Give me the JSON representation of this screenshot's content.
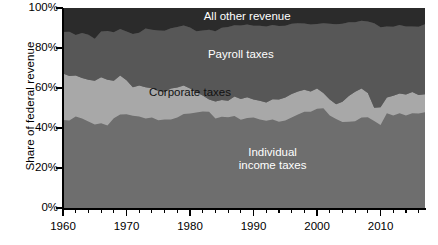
{
  "chart_data": {
    "type": "area",
    "stacked": true,
    "title": "",
    "xlabel": "",
    "ylabel": "Share of federal revenue",
    "xlim": [
      1960,
      2017
    ],
    "ylim": [
      0,
      100
    ],
    "y_tick_labels": [
      "0%",
      "20%",
      "40%",
      "60%",
      "80%",
      "100%"
    ],
    "y_tick_values": [
      0,
      20,
      40,
      60,
      80,
      100
    ],
    "x_tick_labels": [
      "1960",
      "1970",
      "1980",
      "1990",
      "2000",
      "2010"
    ],
    "x_tick_values": [
      1960,
      1970,
      1980,
      1990,
      2000,
      2010
    ],
    "x_minor_tick_interval": 2,
    "grid": false,
    "legend_position": "inline-annotations",
    "colors": {
      "individual_income_taxes": "#6e6e6e",
      "corporate_taxes": "#a8a8a8",
      "payroll_taxes": "#575757",
      "all_other_revenue": "#2b2b2b",
      "axis": "#000000",
      "background": "#ffffff",
      "label_text": "#ffffff"
    },
    "x": [
      1960,
      1961,
      1962,
      1963,
      1964,
      1965,
      1966,
      1967,
      1968,
      1969,
      1970,
      1971,
      1972,
      1973,
      1974,
      1975,
      1976,
      1977,
      1978,
      1979,
      1980,
      1981,
      1982,
      1983,
      1984,
      1985,
      1986,
      1987,
      1988,
      1989,
      1990,
      1991,
      1992,
      1993,
      1994,
      1995,
      1996,
      1997,
      1998,
      1999,
      2000,
      2001,
      2002,
      2003,
      2004,
      2005,
      2006,
      2007,
      2008,
      2009,
      2010,
      2011,
      2012,
      2013,
      2014,
      2015,
      2016,
      2017
    ],
    "series": [
      {
        "name": "Individual income taxes",
        "label": "Individual\nincome taxes",
        "color": "#6e6e6e",
        "values": [
          44.0,
          43.8,
          45.7,
          44.7,
          43.2,
          41.8,
          42.4,
          41.3,
          44.9,
          46.7,
          46.9,
          46.1,
          45.7,
          44.7,
          45.2,
          43.9,
          44.2,
          44.3,
          45.3,
          47.0,
          47.2,
          47.7,
          48.2,
          48.1,
          44.8,
          45.6,
          45.4,
          46.0,
          44.1,
          45.0,
          45.2,
          44.3,
          43.6,
          44.2,
          43.1,
          43.7,
          45.2,
          46.7,
          48.1,
          48.1,
          49.6,
          49.9,
          46.3,
          44.5,
          43.0,
          43.1,
          43.4,
          45.3,
          45.4,
          43.5,
          41.5,
          47.4,
          46.2,
          47.4,
          46.2,
          47.4,
          47.3,
          47.9
        ]
      },
      {
        "name": "Corporate taxes",
        "label": "Corporate taxes",
        "color": "#a8a8a8",
        "values": [
          23.2,
          22.2,
          20.6,
          20.3,
          20.9,
          21.8,
          23.0,
          22.8,
          18.7,
          19.6,
          17.0,
          14.3,
          15.5,
          15.7,
          14.7,
          14.6,
          13.9,
          15.4,
          15.0,
          14.2,
          12.5,
          10.2,
          8.0,
          6.2,
          8.5,
          8.4,
          8.2,
          9.8,
          10.4,
          10.4,
          9.1,
          9.3,
          9.2,
          10.2,
          11.2,
          11.6,
          11.8,
          11.5,
          11.0,
          10.1,
          10.2,
          7.6,
          8.0,
          7.4,
          10.1,
          12.9,
          14.7,
          14.4,
          12.1,
          6.6,
          8.9,
          7.9,
          9.9,
          9.9,
          10.6,
          10.6,
          9.2,
          9.0
        ]
      },
      {
        "name": "Payroll taxes",
        "label": "Payroll taxes",
        "color": "#575757",
        "values": [
          20.8,
          22.1,
          20.2,
          22.5,
          22.5,
          21.0,
          22.9,
          24.4,
          24.3,
          23.2,
          24.4,
          26.6,
          26.4,
          29.3,
          29.2,
          30.3,
          30.5,
          30.2,
          30.2,
          30.0,
          30.5,
          30.5,
          32.6,
          34.8,
          35.1,
          36.1,
          36.9,
          35.6,
          36.8,
          36.3,
          36.8,
          37.5,
          37.9,
          37.1,
          36.7,
          35.8,
          35.1,
          34.2,
          33.2,
          33.5,
          32.2,
          34.9,
          37.8,
          40.0,
          39.0,
          36.9,
          34.8,
          33.9,
          35.7,
          42.3,
          40.0,
          35.5,
          34.5,
          34.2,
          33.9,
          32.8,
          34.1,
          35.0
        ]
      },
      {
        "name": "All other revenue",
        "label": "All other revenue",
        "color": "#2b2b2b",
        "values": [
          12.0,
          11.9,
          13.5,
          12.5,
          13.4,
          15.4,
          11.7,
          11.5,
          12.1,
          10.5,
          11.7,
          13.0,
          12.4,
          10.3,
          10.9,
          11.2,
          11.4,
          10.1,
          9.5,
          8.8,
          9.8,
          11.6,
          11.2,
          10.9,
          11.6,
          9.9,
          9.5,
          8.6,
          8.7,
          8.3,
          8.9,
          8.9,
          9.3,
          8.5,
          9.0,
          8.9,
          7.9,
          7.6,
          7.7,
          8.3,
          8.0,
          7.6,
          7.9,
          8.1,
          7.9,
          7.1,
          7.1,
          6.4,
          6.8,
          7.6,
          9.6,
          9.2,
          9.4,
          8.5,
          9.3,
          9.2,
          9.4,
          8.1
        ]
      }
    ]
  },
  "annotations": [
    {
      "name": "all-other-revenue",
      "text": "All other revenue",
      "x_year": 1989,
      "y_pct": 95.5,
      "color": "light"
    },
    {
      "name": "payroll-taxes",
      "text": "Payroll taxes",
      "x_year": 1988,
      "y_pct": 76.5,
      "color": "light"
    },
    {
      "name": "corporate-taxes",
      "text": "Corporate taxes",
      "x_year": 1980,
      "y_pct": 57.5,
      "color": "dark"
    },
    {
      "name": "individual-income-taxes-line1",
      "text": "Individual",
      "x_year": 1993,
      "y_pct": 27.5,
      "color": "light"
    },
    {
      "name": "individual-income-taxes-line2",
      "text": "income taxes",
      "x_year": 1993,
      "y_pct": 21.0,
      "color": "light"
    }
  ]
}
